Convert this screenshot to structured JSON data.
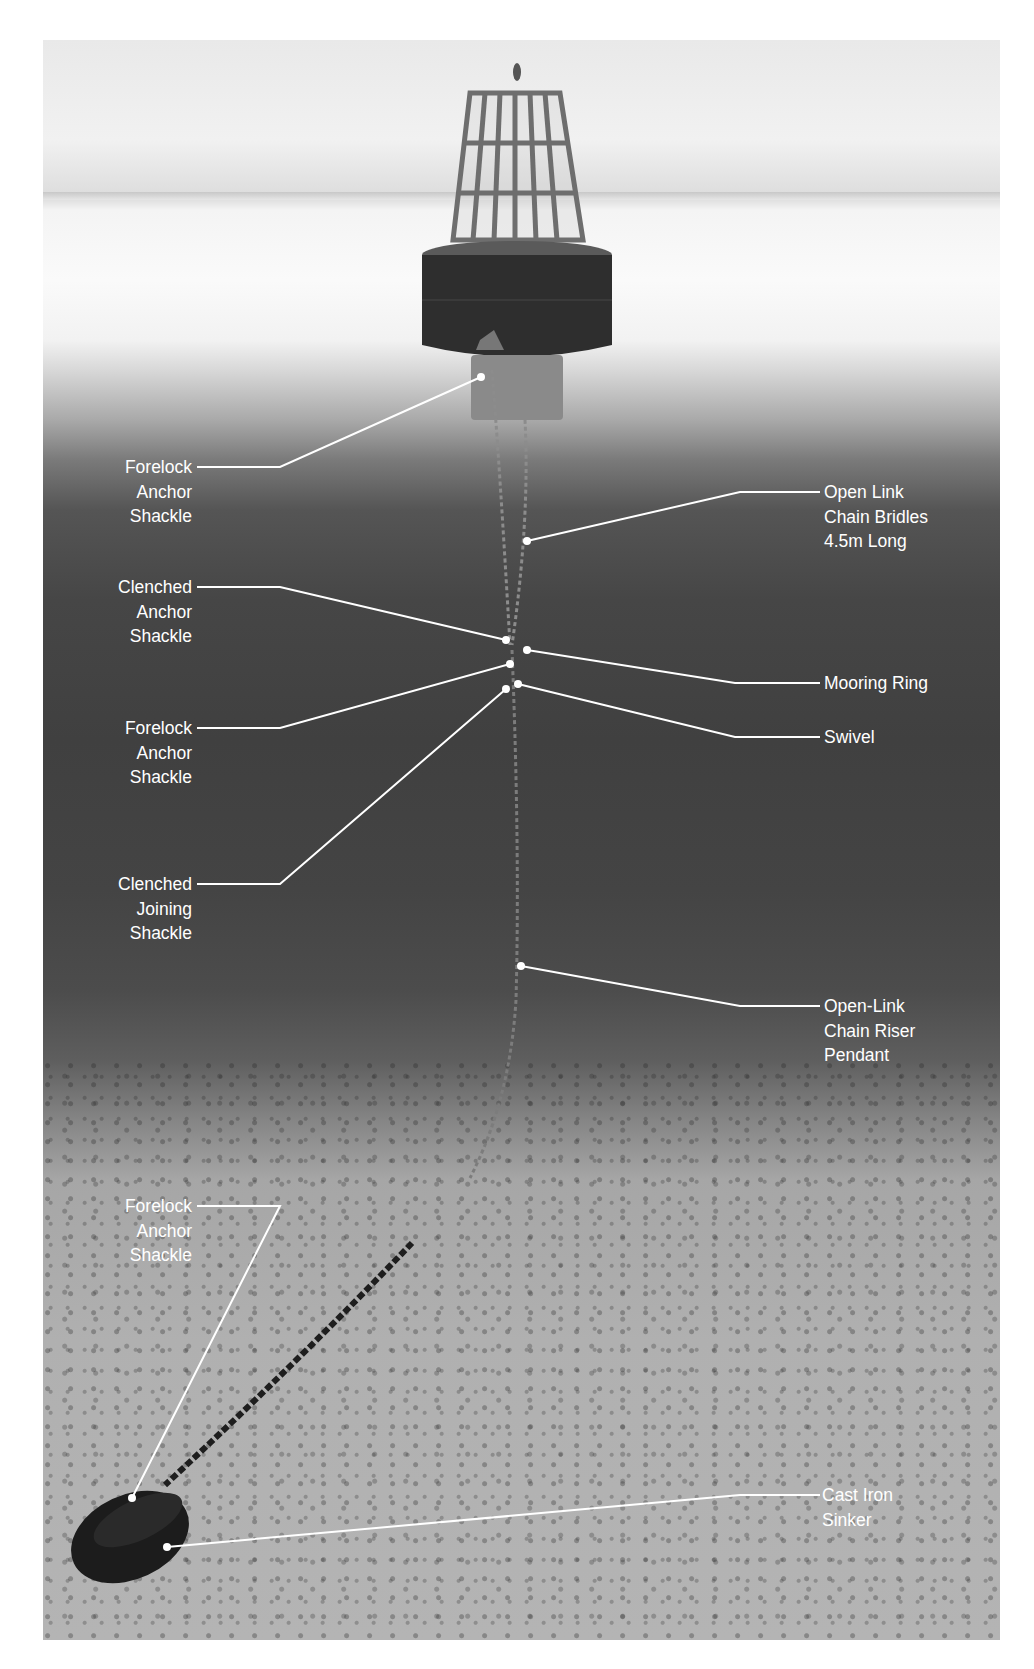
{
  "diagram": {
    "title_partial_visible": "",
    "labels": [
      {
        "id": "forelock-anchor-shackle-top",
        "side": "left",
        "lines": [
          "Forelock",
          "Anchor",
          "Shackle"
        ]
      },
      {
        "id": "open-link-chain-bridles",
        "side": "right",
        "lines": [
          "Open Link",
          "Chain Bridles",
          "4.5m Long"
        ]
      },
      {
        "id": "clenched-anchor-shackle",
        "side": "left",
        "lines": [
          "Clenched",
          "Anchor",
          "Shackle"
        ]
      },
      {
        "id": "mooring-ring",
        "side": "right",
        "lines": [
          "Mooring Ring"
        ]
      },
      {
        "id": "forelock-anchor-shackle-mid",
        "side": "left",
        "lines": [
          "Forelock",
          "Anchor",
          "Shackle"
        ]
      },
      {
        "id": "swivel",
        "side": "right",
        "lines": [
          "Swivel"
        ]
      },
      {
        "id": "clenched-joining-shackle",
        "side": "left",
        "lines": [
          "Clenched",
          "Joining",
          "Shackle"
        ]
      },
      {
        "id": "open-link-chain-riser-pendant",
        "side": "right",
        "lines": [
          "Open-Link",
          "Chain Riser",
          "Pendant"
        ]
      },
      {
        "id": "forelock-anchor-shackle-bottom",
        "side": "left",
        "lines": [
          "Forelock",
          "Anchor",
          "Shackle"
        ]
      },
      {
        "id": "cast-iron-sinker",
        "side": "right",
        "lines": [
          "Cast Iron",
          "Sinker"
        ]
      }
    ],
    "colors": {
      "leader_line": "#ffffff",
      "label_text": "#ffffff",
      "buoy_body": "#2e2e2e",
      "buoy_cage": "#6e6e6e",
      "sinker": "#1c1c1c"
    }
  }
}
